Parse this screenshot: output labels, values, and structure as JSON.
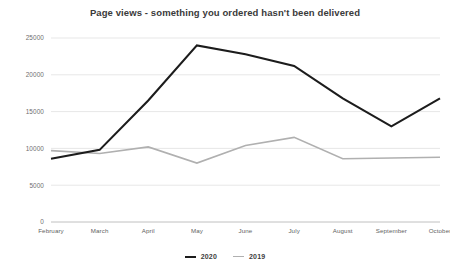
{
  "chart_data": {
    "type": "line",
    "title": "Page views - something you ordered hasn't been delivered",
    "xlabel": "",
    "ylabel": "",
    "categories": [
      "February",
      "March",
      "April",
      "May",
      "June",
      "July",
      "August",
      "September",
      "October"
    ],
    "ylim": [
      0,
      25000
    ],
    "yticks": [
      0,
      5000,
      10000,
      15000,
      20000,
      25000
    ],
    "ytick_labels": [
      "0",
      "5000",
      "10000",
      "15000",
      "20000",
      "25000"
    ],
    "grid": true,
    "legend_position": "bottom",
    "series": [
      {
        "name": "2020",
        "color": "#1c1c1c",
        "width": 2.1,
        "values": [
          8600,
          9800,
          16500,
          24000,
          22800,
          21200,
          16800,
          13000,
          16800
        ]
      },
      {
        "name": "2019",
        "color": "#b0b0b0",
        "width": 1.6,
        "values": [
          9700,
          9300,
          10200,
          8000,
          10400,
          11500,
          8600,
          8700,
          8800
        ]
      }
    ]
  },
  "legend": {
    "entries": [
      {
        "label": "2020",
        "color": "#1c1c1c"
      },
      {
        "label": "2019",
        "color": "#b0b0b0"
      }
    ]
  },
  "colors": {
    "series_2020": "#1c1c1c",
    "series_2019": "#b0b0b0",
    "gridline": "#dcdcdc",
    "axis": "#b9b9b9",
    "title_text": "#3a3a3a",
    "tick_text": "#6e6e6e",
    "background": "#ffffff"
  }
}
